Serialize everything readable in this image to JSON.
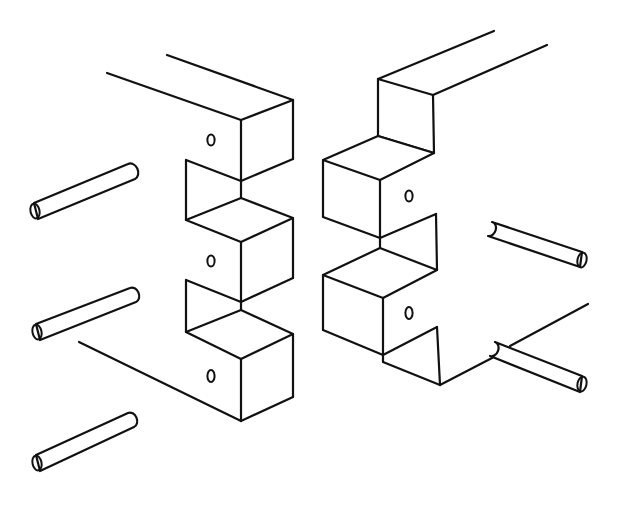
{
  "figure": {
    "background_color": "#ffffff",
    "line_color": "#111111",
    "parts": {
      "left_piece": {
        "fingers": 3,
        "notches": 2,
        "dowel_holes": 3
      },
      "right_piece": {
        "fingers": 2,
        "notches": 2,
        "dowel_holes": 2
      },
      "dowels_left": 3,
      "dowels_right": 2
    },
    "labels": []
  }
}
